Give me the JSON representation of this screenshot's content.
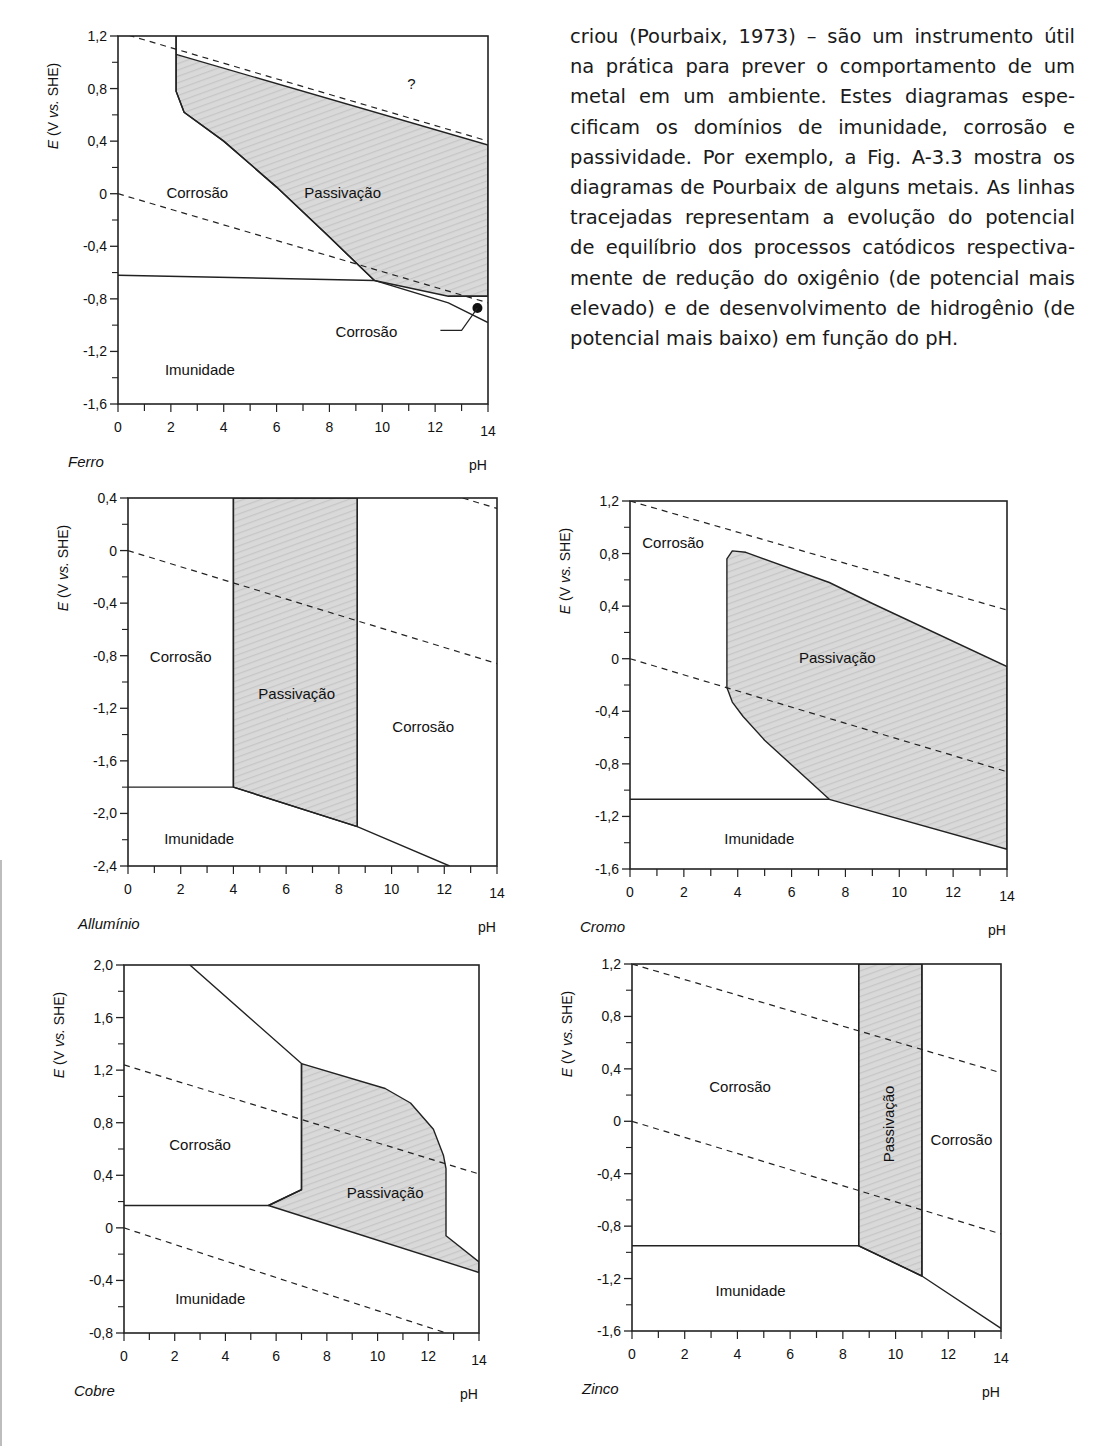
{
  "page": {
    "top_cut_text": "…",
    "paragraph_lines": [
      "criou (Pourbaix, 1973) – são um instrumento útil",
      "na prática para prever o comportamento de um",
      "metal em um ambiente. Estes diagramas espe-",
      "cificam os domínios de imunidade, corrosão e",
      "passividade. Por exemplo, a Fig. A-3.3 mostra os",
      "diagramas de Pourbaix de alguns metais. As linhas",
      "tracejadas representam a evolução do potencial",
      "de equilíbrio dos processos catódicos respectiva-",
      "mente de redução do oxigênio (de potencial mais",
      "elevado) e de desenvolvimento de hidrogênio (de",
      "potencial mais baixo) em função do pH."
    ],
    "bottom_cut_text": "…"
  },
  "chart_data": [
    {
      "type": "area",
      "metal": "Ferro",
      "title": "Ferro",
      "xlabel": "pH",
      "ylabel": "E (V vs. SHE)",
      "xlim": [
        0,
        14
      ],
      "ylim": [
        -1.6,
        1.2
      ],
      "x_ticks": [
        "0",
        "2",
        "4",
        "6",
        "8",
        "10",
        "12",
        "14"
      ],
      "y_ticks": [
        "1,2",
        "0,8",
        "0,4",
        "0",
        "-0,4",
        "-0,8",
        "-1,2",
        "-1,6"
      ],
      "frame": {
        "left": 118,
        "top": 36,
        "right": 488,
        "bottom": 404
      },
      "passivation_polygon": [
        [
          2.2,
          1.2
        ],
        [
          2.2,
          0.78
        ],
        [
          2.5,
          0.62
        ],
        [
          4,
          0.4
        ],
        [
          6,
          0.05
        ],
        [
          8,
          -0.33
        ],
        [
          9.7,
          -0.66
        ],
        [
          12.5,
          -0.78
        ],
        [
          14,
          -0.78
        ],
        [
          14,
          0.37
        ],
        [
          2.2,
          1.06
        ]
      ],
      "solid_lines": [
        [
          [
            0,
            -0.62
          ],
          [
            9.7,
            -0.66
          ]
        ],
        [
          [
            2.2,
            1.2
          ],
          [
            2.2,
            0.78
          ],
          [
            2.5,
            0.62
          ],
          [
            4,
            0.4
          ],
          [
            6,
            0.05
          ],
          [
            8,
            -0.33
          ],
          [
            9.7,
            -0.66
          ],
          [
            12.5,
            -0.83
          ],
          [
            14,
            -0.98
          ]
        ],
        [
          [
            12.5,
            -0.78
          ],
          [
            14,
            -0.78
          ]
        ]
      ],
      "dashed_lines": [
        [
          [
            0,
            1.23
          ],
          [
            14,
            0.4
          ]
        ],
        [
          [
            0,
            0
          ],
          [
            14,
            -0.83
          ]
        ]
      ],
      "marker": {
        "x": 13.6,
        "y": -0.87
      },
      "leader": [
        [
          12.2,
          -1.04
        ],
        [
          13.0,
          -1.04
        ],
        [
          13.6,
          -0.87
        ]
      ],
      "regions": [
        {
          "label": "Corrosão",
          "x": 3.0,
          "y": -0.0,
          "rotate": false
        },
        {
          "label": "Passivação",
          "x": 8.5,
          "y": -0.0,
          "rotate": false
        },
        {
          "label": "?",
          "x": 11.1,
          "y": 0.83,
          "rotate": false
        },
        {
          "label": "Corrosão",
          "x": 9.4,
          "y": -1.06,
          "rotate": false
        },
        {
          "label": "Imunidade",
          "x": 3.1,
          "y": -1.35,
          "rotate": false
        }
      ]
    },
    {
      "type": "area",
      "metal": "Allumínio",
      "title": "Allumínio",
      "xlabel": "pH",
      "ylabel": "E (V vs. SHE)",
      "xlim": [
        0,
        14
      ],
      "ylim": [
        -2.4,
        0.4
      ],
      "x_ticks": [
        "0",
        "2",
        "4",
        "6",
        "8",
        "10",
        "12",
        "14"
      ],
      "y_ticks": [
        "0,4",
        "0",
        "-0,4",
        "-0,8",
        "-1,2",
        "-1,6",
        "-2,0",
        "-2,4"
      ],
      "frame": {
        "left": 128,
        "top": 498,
        "right": 497,
        "bottom": 866
      },
      "passivation_polygon": [
        [
          4,
          0.4
        ],
        [
          4,
          -1.8
        ],
        [
          8.7,
          -2.1
        ],
        [
          8.7,
          0.4
        ]
      ],
      "solid_lines": [
        [
          [
            0,
            -1.8
          ],
          [
            4,
            -1.8
          ],
          [
            8.7,
            -2.1
          ],
          [
            12.2,
            -2.4
          ]
        ],
        [
          [
            4,
            0.4
          ],
          [
            4,
            -1.8
          ]
        ],
        [
          [
            8.7,
            0.4
          ],
          [
            8.7,
            -2.1
          ]
        ]
      ],
      "dashed_lines": [
        [
          [
            0,
            0
          ],
          [
            14,
            -0.86
          ]
        ],
        [
          [
            12.7,
            0.4
          ],
          [
            14,
            0.32
          ]
        ]
      ],
      "regions": [
        {
          "label": "Corrosão",
          "x": 2.0,
          "y": -0.82,
          "rotate": false
        },
        {
          "label": "Passivação",
          "x": 6.4,
          "y": -1.1,
          "rotate": false
        },
        {
          "label": "Corrosão",
          "x": 11.2,
          "y": -1.35,
          "rotate": false
        },
        {
          "label": "Imunidade",
          "x": 2.7,
          "y": -2.2,
          "rotate": false
        }
      ]
    },
    {
      "type": "area",
      "metal": "Cromo",
      "title": "Cromo",
      "xlabel": "pH",
      "ylabel": "E (V vs. SHE)",
      "xlim": [
        0,
        14
      ],
      "ylim": [
        -1.6,
        1.2
      ],
      "x_ticks": [
        "0",
        "2",
        "4",
        "6",
        "8",
        "10",
        "12",
        "14"
      ],
      "y_ticks": [
        "1,2",
        "0,8",
        "0,4",
        "0",
        "-0,4",
        "-0,8",
        "-1,2",
        "-1,6"
      ],
      "frame": {
        "left": 630,
        "top": 501,
        "right": 1007,
        "bottom": 869
      },
      "passivation_polygon": [
        [
          3.6,
          0.76
        ],
        [
          3.8,
          0.82
        ],
        [
          4.3,
          0.81
        ],
        [
          7.4,
          0.58
        ],
        [
          9,
          0.42
        ],
        [
          14,
          -0.06
        ],
        [
          14,
          -1.45
        ],
        [
          7.4,
          -1.07
        ],
        [
          5,
          -0.62
        ],
        [
          4.2,
          -0.44
        ],
        [
          3.8,
          -0.33
        ],
        [
          3.6,
          -0.22
        ]
      ],
      "solid_lines": [
        [
          [
            0,
            -1.07
          ],
          [
            7.4,
            -1.07
          ]
        ]
      ],
      "dashed_lines": [
        [
          [
            0,
            1.2
          ],
          [
            14,
            0.37
          ]
        ],
        [
          [
            0,
            0
          ],
          [
            14,
            -0.86
          ]
        ]
      ],
      "regions": [
        {
          "label": "Corrosão",
          "x": 1.6,
          "y": 0.87,
          "rotate": false
        },
        {
          "label": "Passivação",
          "x": 7.7,
          "y": -0.0,
          "rotate": false
        },
        {
          "label": "Imunidade",
          "x": 4.8,
          "y": -1.38,
          "rotate": false
        }
      ]
    },
    {
      "type": "area",
      "metal": "Cobre",
      "title": "Cobre",
      "xlabel": "pH",
      "ylabel": "E (V vs. SHE)",
      "xlim": [
        0,
        14
      ],
      "ylim": [
        -0.8,
        2.0
      ],
      "x_ticks": [
        "0",
        "2",
        "4",
        "6",
        "8",
        "10",
        "12",
        "14"
      ],
      "y_ticks": [
        "2,0",
        "1,6",
        "1,2",
        "0,8",
        "0,4",
        "0",
        "-0,4",
        "-0,8"
      ],
      "frame": {
        "left": 124,
        "top": 965,
        "right": 479,
        "bottom": 1333
      },
      "passivation_polygon": [
        [
          7,
          1.25
        ],
        [
          10.3,
          1.06
        ],
        [
          11.3,
          0.95
        ],
        [
          12.2,
          0.75
        ],
        [
          12.6,
          0.55
        ],
        [
          12.7,
          0.45
        ],
        [
          12.7,
          -0.06
        ],
        [
          14,
          -0.26
        ],
        [
          14,
          -0.34
        ],
        [
          5.7,
          0.17
        ],
        [
          7,
          0.29
        ]
      ],
      "solid_lines": [
        [
          [
            2.6,
            2.0
          ],
          [
            7,
            1.25
          ],
          [
            7,
            0.29
          ],
          [
            5.7,
            0.17
          ],
          [
            0,
            0.17
          ]
        ]
      ],
      "dashed_lines": [
        [
          [
            0,
            1.24
          ],
          [
            14,
            0.41
          ]
        ],
        [
          [
            0,
            0
          ],
          [
            12.7,
            -0.8
          ]
        ]
      ],
      "regions": [
        {
          "label": "Corrosão",
          "x": 3.0,
          "y": 0.62,
          "rotate": false
        },
        {
          "label": "Passivação",
          "x": 10.3,
          "y": 0.26,
          "rotate": false
        },
        {
          "label": "Imunidade",
          "x": 3.4,
          "y": -0.55,
          "rotate": false
        }
      ]
    },
    {
      "type": "area",
      "metal": "Zinco",
      "title": "Zinco",
      "xlabel": "pH",
      "ylabel": "E (V vs. SHE)",
      "xlim": [
        0,
        14
      ],
      "ylim": [
        -1.6,
        1.2
      ],
      "x_ticks": [
        "0",
        "2",
        "4",
        "6",
        "8",
        "10",
        "12",
        "14"
      ],
      "y_ticks": [
        "1,2",
        "0,8",
        "0,4",
        "0",
        "-0,4",
        "-0,8",
        "-1,2",
        "-1,6"
      ],
      "frame": {
        "left": 632,
        "top": 964,
        "right": 1001,
        "bottom": 1331
      },
      "passivation_polygon": [
        [
          8.6,
          1.2
        ],
        [
          8.6,
          -0.95
        ],
        [
          11,
          -1.18
        ],
        [
          11,
          1.2
        ]
      ],
      "solid_lines": [
        [
          [
            0,
            -0.95
          ],
          [
            8.6,
            -0.95
          ],
          [
            11,
            -1.18
          ],
          [
            14,
            -1.58
          ]
        ],
        [
          [
            8.6,
            1.2
          ],
          [
            8.6,
            -0.95
          ]
        ],
        [
          [
            11,
            1.2
          ],
          [
            11,
            -1.18
          ]
        ]
      ],
      "dashed_lines": [
        [
          [
            0,
            1.2
          ],
          [
            14,
            0.37
          ]
        ],
        [
          [
            0,
            0
          ],
          [
            14,
            -0.86
          ]
        ]
      ],
      "regions": [
        {
          "label": "Corrosão",
          "x": 4.1,
          "y": 0.25,
          "rotate": false
        },
        {
          "label": "Passivação",
          "x": 9.8,
          "y": -0.02,
          "rotate": true
        },
        {
          "label": "Corrosão",
          "x": 12.5,
          "y": -0.15,
          "rotate": false
        },
        {
          "label": "Imunidade",
          "x": 4.5,
          "y": -1.3,
          "rotate": false
        }
      ]
    }
  ]
}
